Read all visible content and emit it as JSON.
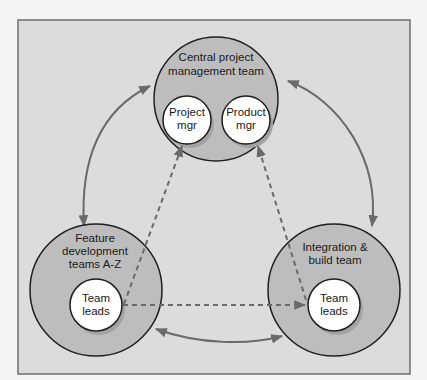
{
  "diagram": {
    "frame": {
      "background": "#dcdcdc",
      "border": "#6f6f6f"
    },
    "colors": {
      "outer_circle": "#bdbdbd",
      "inner_circle": "#ffffff",
      "stroke": "#1f1f1f",
      "arrow": "#6a6a6a",
      "dashed": "#6a6a6a"
    },
    "nodes": {
      "central": {
        "title_line1": "Central project",
        "title_line2": "management team",
        "inner_left": {
          "line1": "Project",
          "line2": "mgr"
        },
        "inner_right": {
          "line1": "Product",
          "line2": "mgr"
        }
      },
      "feature": {
        "title_line1": "Feature",
        "title_line2": "development",
        "title_line3": "teams A-Z",
        "inner": {
          "line1": "Team",
          "line2": "leads"
        }
      },
      "integration": {
        "title_line1": "Integration &",
        "title_line2": "build team",
        "inner": {
          "line1": "Team",
          "line2": "leads"
        }
      }
    },
    "edges": [
      {
        "from": "central",
        "to": "feature",
        "style": "solid",
        "direction": "both"
      },
      {
        "from": "central",
        "to": "integration",
        "style": "solid",
        "direction": "both"
      },
      {
        "from": "feature",
        "to": "integration",
        "style": "solid",
        "direction": "both"
      },
      {
        "from": "feature.team_leads",
        "to": "central.project_mgr",
        "style": "dashed",
        "direction": "forward"
      },
      {
        "from": "integration.team_leads",
        "to": "central.product_mgr",
        "style": "dashed",
        "direction": "forward"
      },
      {
        "from": "feature.team_leads",
        "to": "integration.team_leads",
        "style": "dashed",
        "direction": "forward"
      }
    ]
  }
}
